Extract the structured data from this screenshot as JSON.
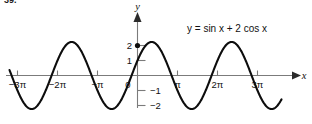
{
  "figure": {
    "problem_number": "39.",
    "equation_label": "y = sin x + 2 cos x",
    "equation_parts": {
      "y": "y",
      "equals": "=",
      "body": "sin x + 2 cos x"
    },
    "x_axis_name": "x",
    "y_axis_name": "y"
  },
  "chart_data": {
    "type": "line",
    "title": "",
    "subtitle": "",
    "xlabel": "x",
    "ylabel": "y",
    "equation": "y = sin x + 2 cos x",
    "grid": false,
    "legend": "none",
    "annotations": [
      {
        "text": "y = sin x + 2 cos x",
        "x": 1.6,
        "y": 2.9,
        "role": "curve-equation"
      }
    ],
    "xlim": [
      -3.55,
      3.9
    ],
    "ylim": [
      -2.7,
      3.2
    ],
    "xunit": "pi",
    "xtick_values": [
      -3,
      -2,
      -1,
      0,
      1,
      2,
      3
    ],
    "xtick_labels": [
      "−3π",
      "−2π",
      "−π",
      "0",
      "π",
      "2π",
      "3π"
    ],
    "ytick_values": [
      2,
      1,
      -1,
      -2
    ],
    "ytick_labels": [
      "2",
      "1",
      "−1",
      "−2"
    ],
    "amplitude": 2.236,
    "phase_shift_over_pi": 0.3524,
    "period_over_pi": 2,
    "y_intercept": 2,
    "markers": [
      {
        "x_over_pi": 0,
        "y": 2,
        "label": "y-intercept"
      }
    ],
    "series": [
      {
        "name": "y = sin x + 2 cos x",
        "color": "#0d0d0d",
        "x_over_pi": [
          -3.2,
          -3.1,
          -3.0,
          -2.9,
          -2.8,
          -2.7,
          -2.6,
          -2.5,
          -2.4,
          -2.3,
          -2.2,
          -2.1,
          -2.0,
          -1.9,
          -1.8,
          -1.7,
          -1.6,
          -1.5,
          -1.4,
          -1.3,
          -1.2,
          -1.1,
          -1.0,
          -0.9,
          -0.8,
          -0.7,
          -0.6,
          -0.5,
          -0.4,
          -0.3,
          -0.2,
          -0.1,
          0.0,
          0.1,
          0.2,
          0.3,
          0.4,
          0.5,
          0.6,
          0.7,
          0.8,
          0.9,
          1.0,
          1.1,
          1.2,
          1.3,
          1.4,
          1.5,
          1.6,
          1.7,
          1.8,
          1.9,
          2.0,
          2.1,
          2.2,
          2.3,
          2.4,
          2.5,
          2.6,
          2.7,
          2.8,
          2.9,
          3.0,
          3.1,
          3.2,
          3.3,
          3.4,
          3.5,
          3.6
        ],
        "y": [
          -2.06,
          -2.22,
          -2.23,
          -2.09,
          -1.81,
          -1.39,
          -0.87,
          -0.27,
          0.36,
          0.97,
          1.52,
          1.96,
          2.24,
          2.23,
          2.09,
          1.81,
          1.39,
          0.87,
          0.27,
          -0.36,
          -0.97,
          -1.52,
          -1.96,
          -2.24,
          -2.23,
          -2.09,
          -1.81,
          -1.39,
          -0.87,
          -0.27,
          0.36,
          0.97,
          2.0,
          2.22,
          2.23,
          2.09,
          1.81,
          1.39,
          0.87,
          0.27,
          -0.36,
          -0.97,
          -1.52,
          -1.96,
          -2.24,
          -2.23,
          -2.09,
          -1.81,
          -1.39,
          -0.87,
          -0.27,
          0.36,
          0.97,
          1.52,
          1.96,
          2.24,
          2.23,
          2.09,
          1.81,
          1.39,
          0.87,
          0.27,
          -0.36,
          -0.97,
          -1.52,
          -1.96,
          -2.24,
          -2.23,
          -2.09
        ]
      }
    ]
  }
}
